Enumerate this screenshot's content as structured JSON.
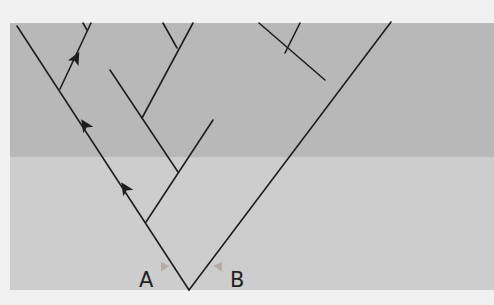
{
  "diagram": {
    "labels": {
      "a": "A",
      "b": "B"
    },
    "colors": {
      "page_background": "#f1f1f1",
      "upper_band": "#b8b8b8",
      "lower_band": "#cdcdcd",
      "branch_line": "#1e1e1e",
      "lineage_arrow": "#a89893"
    },
    "bands": [
      {
        "name": "upper-band",
        "y": 23,
        "height": 134
      },
      {
        "name": "lower-band",
        "y": 157,
        "height": 133
      }
    ],
    "root": {
      "x": 189,
      "y": 290
    },
    "branches": [
      {
        "name": "left-main",
        "from": [
          189,
          290
        ],
        "to": [
          17,
          26
        ]
      },
      {
        "name": "right-main",
        "from": [
          189,
          290
        ],
        "to": [
          391,
          22
        ]
      },
      {
        "name": "clade-2-stem",
        "from": [
          146,
          222
        ],
        "to": [
          213,
          120
        ]
      },
      {
        "name": "clade-2a",
        "from": [
          178,
          172
        ],
        "to": [
          110,
          70
        ]
      },
      {
        "name": "clade-2b",
        "from": [
          142,
          118
        ],
        "to": [
          193,
          23
        ]
      },
      {
        "name": "clade-2b-tip",
        "from": [
          177,
          48
        ],
        "to": [
          163,
          23
        ]
      },
      {
        "name": "clade-1",
        "from": [
          60,
          89
        ],
        "to": [
          91,
          23
        ]
      },
      {
        "name": "clade-1-tip",
        "from": [
          87,
          30
        ],
        "to": [
          83,
          23
        ]
      },
      {
        "name": "clade-3",
        "from": [
          325,
          80
        ],
        "to": [
          259,
          23
        ]
      },
      {
        "name": "clade-3-tip",
        "from": [
          285,
          53
        ],
        "to": [
          300,
          23
        ]
      }
    ],
    "direction_arrowheads": [
      {
        "x": 76,
        "y": 58,
        "angle": -62
      },
      {
        "x": 85,
        "y": 125,
        "angle": -123
      },
      {
        "x": 125,
        "y": 188,
        "angle": -123
      }
    ],
    "lineage_arrows": [
      {
        "name": "arrow-a",
        "from": [
          175,
          284
        ],
        "to": [
          161,
          262
        ]
      },
      {
        "name": "arrow-b",
        "from": [
          207,
          284
        ],
        "to": [
          222,
          262
        ]
      }
    ]
  }
}
